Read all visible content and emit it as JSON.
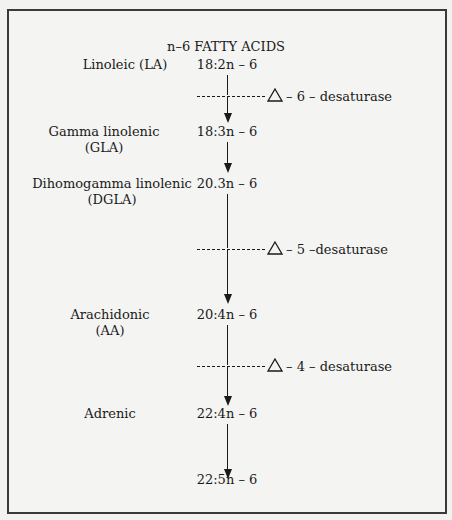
{
  "diagram": {
    "title": "n–6 FATTY ACIDS",
    "acids": [
      {
        "name_line1": "Linoleic (LA)",
        "name_line2": "",
        "formula": "18:2n – 6"
      },
      {
        "name_line1": "Gamma linolenic",
        "name_line2": "(GLA)",
        "formula": "18:3n – 6"
      },
      {
        "name_line1": "Dihomogamma linolenic",
        "name_line2": "(DGLA)",
        "formula": "20.3n – 6"
      },
      {
        "name_line1": "Arachidonic",
        "name_line2": "(AA)",
        "formula": "20:4n – 6"
      },
      {
        "name_line1": "Adrenic",
        "name_line2": "",
        "formula": "22:4n – 6"
      },
      {
        "name_line1": "",
        "name_line2": "",
        "formula": "22:5n – 6"
      }
    ],
    "enzymes": [
      {
        "label": "– 6 – desaturase",
        "symbol": "delta-triangle"
      },
      {
        "label": "– 5 –desaturase",
        "symbol": "delta-triangle"
      },
      {
        "label": "– 4 – desaturase",
        "symbol": "delta-triangle"
      }
    ],
    "colors": {
      "ink": "#1a1a1a",
      "border": "#3a3a3a",
      "paper": "#f4f4f2"
    }
  }
}
